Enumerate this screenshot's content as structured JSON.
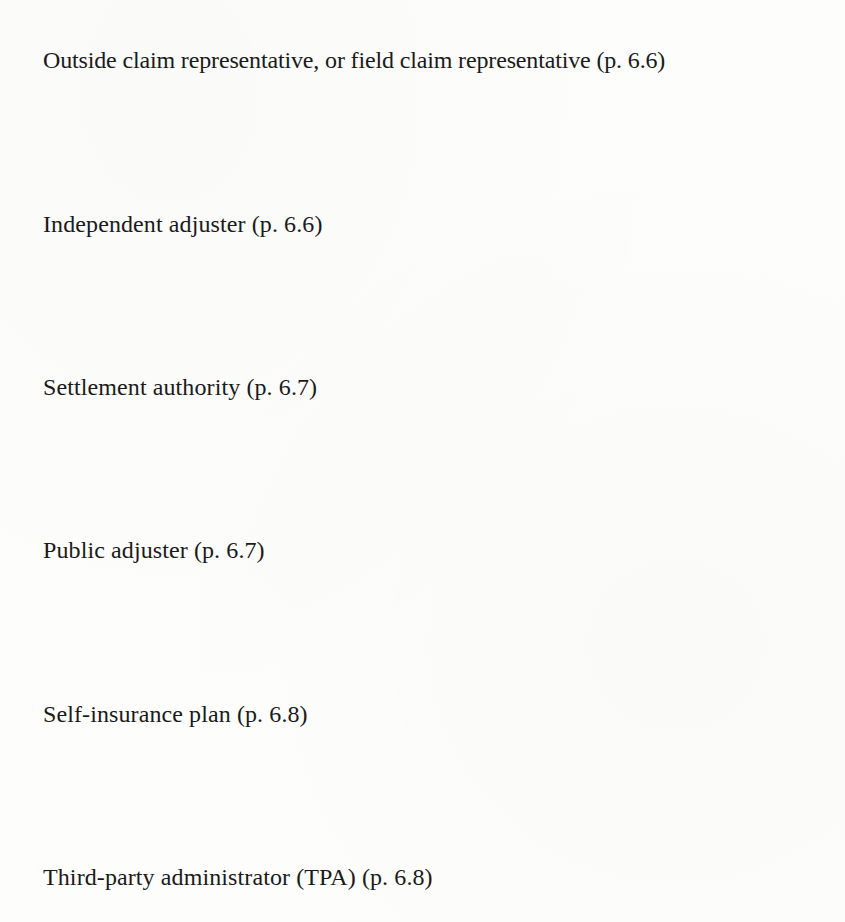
{
  "document": {
    "terms": [
      {
        "term": "Outside claim representative, or field claim representative",
        "page_ref": "(p. 6.6)",
        "text": "Outside claim representative, or field claim representative (p. 6.6)"
      },
      {
        "term": "Independent adjuster",
        "page_ref": "(p. 6.6)",
        "text": "Independent adjuster (p. 6.6)"
      },
      {
        "term": "Settlement authority",
        "page_ref": "(p. 6.7)",
        "text": "Settlement authority (p. 6.7)"
      },
      {
        "term": "Public adjuster",
        "page_ref": "(p. 6.7)",
        "text": "Public adjuster (p. 6.7)"
      },
      {
        "term": "Self-insurance plan",
        "page_ref": "(p. 6.8)",
        "text": "Self-insurance plan (p. 6.8)"
      },
      {
        "term": "Third-party administrator (TPA)",
        "page_ref": "(p. 6.8)",
        "text": "Third-party administrator (TPA) (p. 6.8)"
      }
    ]
  }
}
